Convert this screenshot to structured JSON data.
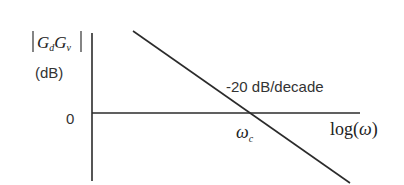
{
  "diagram": {
    "type": "bode-magnitude-asymptote",
    "y_axis": {
      "label_base": "G",
      "label_sub1": "d",
      "label_sub2": "v",
      "unit": "(dB)",
      "zero_tick": "0"
    },
    "x_axis": {
      "label_prefix": "log(",
      "label_symbol": "ω",
      "label_suffix": ")"
    },
    "line": {
      "slope_label": "-20 dB/decade"
    },
    "crossover": {
      "symbol": "ω",
      "subscript": "c"
    },
    "colors": {
      "line": "#2b2b2b",
      "text": "#333333"
    }
  }
}
